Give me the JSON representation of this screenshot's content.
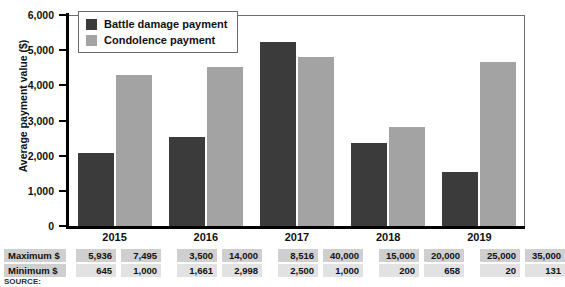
{
  "chart_data": {
    "type": "bar",
    "title": "",
    "xlabel": "",
    "ylabel": "Average payment value ($)",
    "categories": [
      "2015",
      "2016",
      "2017",
      "2018",
      "2019"
    ],
    "series": [
      {
        "name": "Battle damage payment",
        "color": "#3b3b3b",
        "values": [
          2080,
          2530,
          5230,
          2350,
          1540
        ]
      },
      {
        "name": "Condolence payment",
        "color": "#a3a3a3",
        "values": [
          4290,
          4530,
          4810,
          2810,
          4660
        ]
      }
    ],
    "ylim": [
      0,
      6000
    ],
    "yticks": [
      "0",
      "1,000",
      "2,000",
      "3,000",
      "4,000",
      "5,000",
      "6,000"
    ],
    "ytick_values": [
      0,
      1000,
      2000,
      3000,
      4000,
      5000,
      6000
    ],
    "grid": false,
    "legend_position": "top-left"
  },
  "legend": {
    "items": [
      {
        "label": "Battle damage payment",
        "swatch": "dark"
      },
      {
        "label": "Condolence payment",
        "swatch": "light"
      }
    ]
  },
  "table": {
    "rows": [
      {
        "header": "Maximum $",
        "groups": [
          {
            "year": "2015",
            "battle": "5,936",
            "condolence": "7,495"
          },
          {
            "year": "2016",
            "battle": "3,500",
            "condolence": "14,000"
          },
          {
            "year": "2017",
            "battle": "8,516",
            "condolence": "40,000"
          },
          {
            "year": "2018",
            "battle": "15,000",
            "condolence": "20,000"
          },
          {
            "year": "2019",
            "battle": "25,000",
            "condolence": "35,000"
          }
        ]
      },
      {
        "header": "Minimum $",
        "groups": [
          {
            "year": "2015",
            "battle": "645",
            "condolence": "1,000"
          },
          {
            "year": "2016",
            "battle": "1,661",
            "condolence": "2,998"
          },
          {
            "year": "2017",
            "battle": "2,500",
            "condolence": "1,000"
          },
          {
            "year": "2018",
            "battle": "200",
            "condolence": "658"
          },
          {
            "year": "2019",
            "battle": "20",
            "condolence": "131"
          }
        ]
      }
    ]
  },
  "source": {
    "text": "SOURCE:"
  }
}
